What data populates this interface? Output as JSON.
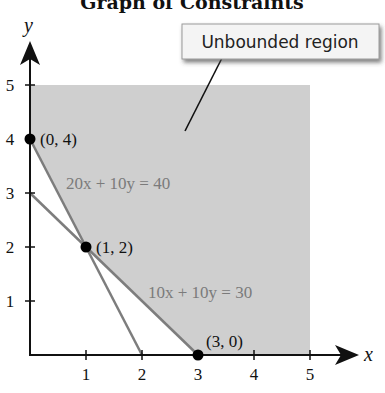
{
  "title": "Graph of Constraints",
  "callout": {
    "text": "Unbounded region"
  },
  "colors": {
    "region_fill": "#cfcfcf",
    "constraint_line": "#7d7d7d",
    "axis": "#111111",
    "point": "#000000",
    "equation_text": "#7b7b7b"
  },
  "chart_data": {
    "type": "line",
    "title": "Graph of Constraints",
    "xlabel": "x",
    "ylabel": "y",
    "xlim": [
      0,
      5
    ],
    "ylim": [
      0,
      5
    ],
    "x_ticks": [
      "1",
      "2",
      "3",
      "4",
      "5"
    ],
    "y_ticks": [
      "1",
      "2",
      "3",
      "4",
      "5"
    ],
    "grid": false,
    "region": {
      "label": "Unbounded region",
      "vertices": [
        [
          0,
          5
        ],
        [
          0,
          4
        ],
        [
          1,
          2
        ],
        [
          3,
          0
        ],
        [
          5,
          0
        ],
        [
          5,
          5
        ]
      ]
    },
    "constraints": [
      {
        "name": "20x + 10y = 40",
        "lhs": "20x + 10y",
        "rhs": "40",
        "from": [
          0,
          4
        ],
        "to": [
          2,
          0
        ]
      },
      {
        "name": "10x + 10y = 30",
        "lhs": "10x + 10y",
        "rhs": "30",
        "from": [
          0,
          3
        ],
        "to": [
          3,
          0
        ]
      }
    ],
    "points": [
      {
        "x": 0,
        "y": 4,
        "label": "(0, 4)"
      },
      {
        "x": 1,
        "y": 2,
        "label": "(1, 2)"
      },
      {
        "x": 3,
        "y": 0,
        "label": "(3, 0)"
      }
    ]
  }
}
